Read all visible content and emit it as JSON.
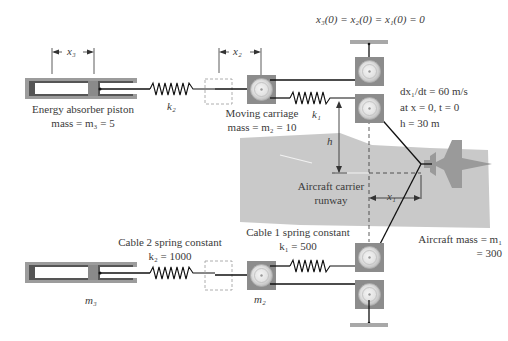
{
  "initial_condition": "x₃(0) = x₂(0) = x₁(0) = 0",
  "aircraft_conditions": {
    "velocity": "dx₁/dt = 60 m/s",
    "at": "at x = 0, t = 0",
    "height": "h = 30 m"
  },
  "top_system": {
    "piston_label": "Energy absorber piston",
    "piston_mass": "mass = m₃ = 5",
    "carriage_label": "Moving carriage",
    "carriage_mass": "mass = m₂ = 10",
    "spring_k2": "k₂",
    "spring_k1": "k₁",
    "dim_x3": "x₃",
    "dim_x2": "x₂",
    "dim_h": "h"
  },
  "runway": {
    "line1": "Aircraft carrier",
    "line2": "runway",
    "dim_x1": "x₁"
  },
  "bottom_system": {
    "cable2_label": "Cable 2 spring constant",
    "cable2_value": "k₂ = 1000",
    "cable1_label": "Cable 1 spring constant",
    "cable1_value": "k₁ = 500",
    "piston_mass": "m₃",
    "carriage_mass": "m₂"
  },
  "aircraft": {
    "mass_label": "Aircraft mass = m₁",
    "mass_value": "= 300"
  },
  "colors": {
    "runway": "#c9c9c9",
    "aircraft": "#9a9a9a",
    "pulley_box": "#8c8c8c",
    "piston_body": "#9c9c9c",
    "ground_bar": "#a8a8a8",
    "cable": "#111111"
  }
}
